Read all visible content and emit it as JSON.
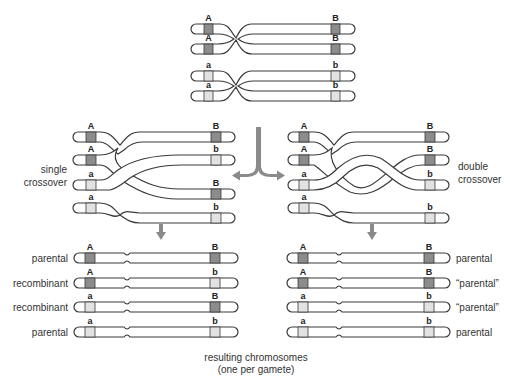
{
  "colors": {
    "dominant_band": "#8c8c8c",
    "recessive_band": "#e2e2e2",
    "outline": "#3a3a3a",
    "arrow": "#8a8a8a"
  },
  "top_diagram": {
    "alleles_left": [
      "A",
      "A",
      "a",
      "a"
    ],
    "alleles_right": [
      "B",
      "B",
      "b",
      "b"
    ]
  },
  "single_crossover": {
    "label_line1": "single",
    "label_line2": "crossover",
    "alleles_left": [
      "A",
      "A",
      "a",
      "a"
    ],
    "alleles_right": [
      "B",
      "b",
      "B",
      "b"
    ]
  },
  "double_crossover": {
    "label_line1": "double",
    "label_line2": "crossover",
    "alleles_left": [
      "A",
      "A",
      "a",
      "a"
    ],
    "alleles_right": [
      "B",
      "B",
      "b",
      "b"
    ]
  },
  "single_results": [
    {
      "left": "A",
      "right": "B",
      "label": "parental"
    },
    {
      "left": "A",
      "right": "b",
      "label": "recombinant"
    },
    {
      "left": "a",
      "right": "B",
      "label": "recombinant"
    },
    {
      "left": "a",
      "right": "b",
      "label": "parental"
    }
  ],
  "double_results": [
    {
      "left": "A",
      "right": "B",
      "label": "parental"
    },
    {
      "left": "A",
      "right": "B",
      "label": "“parental”"
    },
    {
      "left": "a",
      "right": "b",
      "label": "“parental”"
    },
    {
      "left": "a",
      "right": "b",
      "label": "parental"
    }
  ],
  "caption": {
    "line1": "resulting chromosomes",
    "line2": "(one per gamete)"
  }
}
